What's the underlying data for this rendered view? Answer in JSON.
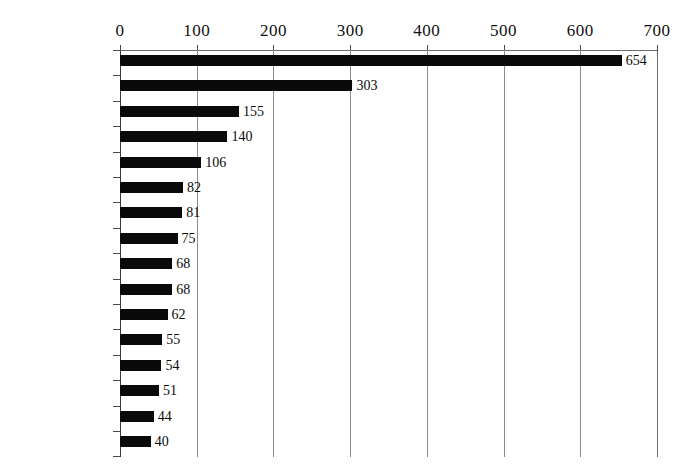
{
  "chart_data": {
    "type": "bar",
    "orientation": "horizontal",
    "title": "",
    "subtitle": "",
    "xlabel": "",
    "ylabel": "",
    "xlim": [
      0,
      700
    ],
    "xticks": [
      0,
      100,
      200,
      300,
      400,
      500,
      600,
      700
    ],
    "xtick_labels": [
      "0",
      "100",
      "200",
      "300",
      "400",
      "500",
      "600",
      "700"
    ],
    "grid": "vertical",
    "legend": "none",
    "bar_color": "#0a0a0a",
    "categories": [
      "イネ",
      "スイカ",
      "イチゴ",
      "ウリ類",
      "サツマイモ",
      "ダイコン",
      "ハクサイ",
      "トウモロコシ",
      "ニンジン",
      "ジャガイモ",
      "カボチャ",
      "ダイズ類",
      "トマト",
      "イモ類",
      "キャベツ",
      "ナス"
    ],
    "values": [
      654,
      303,
      155,
      140,
      106,
      82,
      81,
      75,
      68,
      68,
      62,
      55,
      54,
      51,
      44,
      40
    ],
    "data_labels": [
      "654",
      "303",
      "155",
      "140",
      "106",
      "82",
      "81",
      "75",
      "68",
      "68",
      "62",
      "55",
      "54",
      "51",
      "44",
      "40"
    ]
  }
}
